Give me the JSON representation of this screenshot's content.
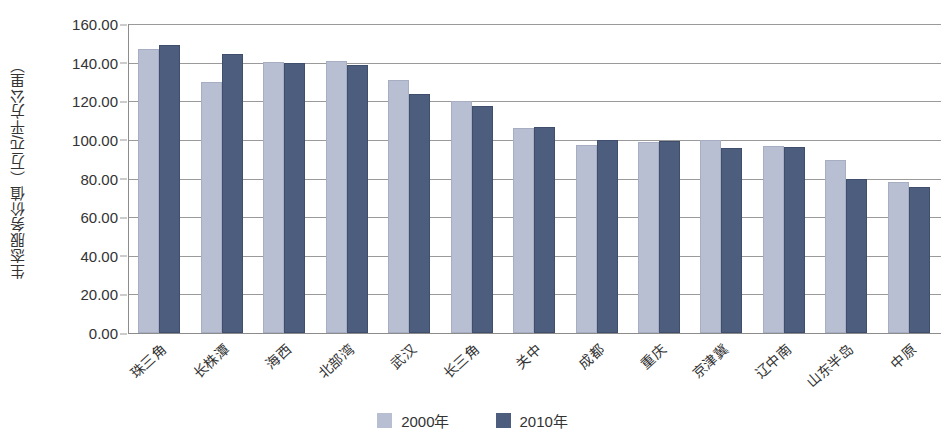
{
  "chart_data": {
    "type": "bar",
    "title": "",
    "xlabel": "",
    "ylabel": "生态服务价值（万元/平方公里）",
    "ylim": [
      0,
      160
    ],
    "ytick_step": 20,
    "ytick_labels": [
      "160.00",
      "140.00",
      "120.00",
      "100.00",
      "80.00",
      "60.00",
      "40.00",
      "20.00",
      "0.00"
    ],
    "ytick_values": [
      160,
      140,
      120,
      100,
      80,
      60,
      40,
      20,
      0
    ],
    "grid": true,
    "legend_position": "bottom-center",
    "categories": [
      "珠三角",
      "长株潭",
      "海西",
      "北部湾",
      "武汉",
      "长三角",
      "关中",
      "成都",
      "重庆",
      "京津冀",
      "辽中南",
      "山东半岛",
      "中原"
    ],
    "series": [
      {
        "name": "2000年",
        "color": "#b9bfd2",
        "values": [
          147.0,
          130.0,
          140.5,
          141.0,
          131.0,
          120.0,
          106.0,
          97.5,
          99.0,
          100.0,
          97.0,
          89.5,
          78.0
        ]
      },
      {
        "name": "2010年",
        "color": "#4d5d7e",
        "values": [
          149.0,
          144.5,
          140.0,
          139.0,
          124.0,
          117.5,
          106.5,
          100.0,
          99.5,
          96.0,
          96.5,
          80.0,
          75.5
        ]
      }
    ]
  },
  "legend": {
    "items": [
      {
        "label": "2000年",
        "color": "#b9bfd2"
      },
      {
        "label": "2010年",
        "color": "#4d5d7e"
      }
    ]
  },
  "colors": {
    "series_2000": "#b9bfd2",
    "series_2010": "#4d5d7e",
    "gridline": "#9a9a9a",
    "axis": "#8c8c8c",
    "text": "#333333",
    "background": "#ffffff"
  }
}
